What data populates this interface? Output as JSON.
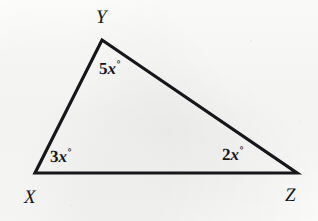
{
  "figure": {
    "kind": "geometry-diagram",
    "shape": "triangle",
    "name": "triangle-xyz",
    "background_color": "#fbfbfa",
    "stroke_color": "#17171b",
    "text_color": "#16161a",
    "stroke_width": 3.2,
    "vertices": [
      {
        "id": "X",
        "label": "X",
        "x": 35,
        "y": 173
      },
      {
        "id": "Y",
        "label": "Y",
        "x": 102,
        "y": 40
      },
      {
        "id": "Z",
        "label": "Z",
        "x": 297,
        "y": 173
      }
    ],
    "sides": [
      {
        "from": "X",
        "to": "Y"
      },
      {
        "from": "Y",
        "to": "Z"
      },
      {
        "from": "X",
        "to": "Z"
      }
    ],
    "angles": [
      {
        "at": "X",
        "coefficient": "3",
        "variable": "x",
        "degree_symbol": "°",
        "text": "3x°"
      },
      {
        "at": "Y",
        "coefficient": "5",
        "variable": "x",
        "degree_symbol": "°",
        "text": "5x°"
      },
      {
        "at": "Z",
        "coefficient": "2",
        "variable": "x",
        "degree_symbol": "°",
        "text": "2x°"
      }
    ]
  }
}
